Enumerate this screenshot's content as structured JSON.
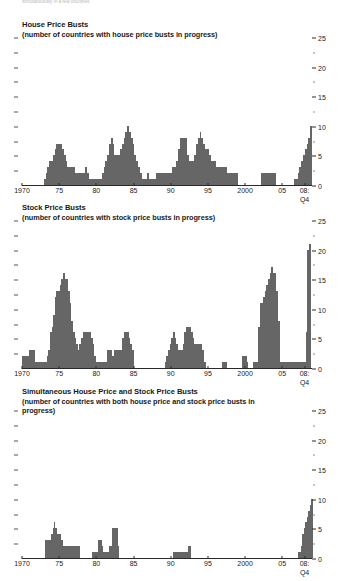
{
  "topnote": "simultaneously in a few countries.",
  "axis": {
    "y_ticks": [
      0,
      5,
      10,
      15,
      20,
      25
    ],
    "y_minor": [
      2.5,
      7.5,
      12.5,
      17.5,
      22.5
    ],
    "ylim": [
      0,
      25
    ],
    "x_ticks": [
      {
        "label": "1970",
        "year": 1970
      },
      {
        "label": "75",
        "year": 1975
      },
      {
        "label": "80",
        "year": 1980
      },
      {
        "label": "85",
        "year": 1985
      },
      {
        "label": "90",
        "year": 1990
      },
      {
        "label": "95",
        "year": 1995
      },
      {
        "label": "2000",
        "year": 2000
      },
      {
        "label": "05",
        "year": 2005
      },
      {
        "label": "08:",
        "year": 2008
      }
    ],
    "last_label_line2": "Q4",
    "xlim": [
      1970,
      2009
    ]
  },
  "colors": {
    "bar": "#666666",
    "axis": "#2a2a2a",
    "text": "#1a1a1a",
    "topnote": "#b9b9b9"
  },
  "chart_data": [
    {
      "type": "bar",
      "title": "House Price Busts",
      "subtitle": "(number of countries with house price busts in progress)",
      "xlabel": "",
      "ylabel": "",
      "ylim": [
        0,
        25
      ],
      "grid": false,
      "legend": "none",
      "y_axis_position": "right",
      "x_start_year": 1970,
      "quarterly": true,
      "values": [
        0,
        0,
        0,
        0,
        0,
        0,
        0,
        0,
        0,
        0,
        0,
        0,
        1,
        2,
        3,
        4,
        4,
        5,
        6,
        7,
        7,
        7,
        6,
        5,
        4,
        3,
        3,
        3,
        3,
        2,
        2,
        2,
        2,
        2,
        2,
        3,
        2,
        1,
        1,
        1,
        1,
        1,
        1,
        1,
        2,
        3,
        4,
        5,
        7,
        8,
        7,
        5,
        5,
        5,
        6,
        7,
        8,
        9,
        10,
        9,
        8,
        7,
        5,
        4,
        3,
        2,
        1,
        1,
        1,
        2,
        1,
        1,
        1,
        1,
        2,
        2,
        2,
        2,
        2,
        2,
        2,
        2,
        2,
        3,
        3,
        4,
        6,
        8,
        8,
        8,
        8,
        5,
        4,
        4,
        4,
        5,
        7,
        8,
        9,
        8,
        7,
        6,
        6,
        5,
        4,
        4,
        4,
        3,
        3,
        3,
        3,
        3,
        3,
        2,
        2,
        2,
        2,
        2,
        2,
        0,
        0,
        0,
        0,
        0,
        0,
        0,
        0,
        0,
        0,
        0,
        0,
        0,
        2,
        2,
        2,
        2,
        2,
        2,
        2,
        2,
        0,
        0,
        0,
        0,
        0,
        0,
        0,
        0,
        0,
        0,
        1,
        1,
        2,
        3,
        4,
        5,
        6,
        7,
        8,
        10
      ]
    },
    {
      "type": "bar",
      "title": "Stock Price Busts",
      "subtitle": "(number of countries with stock price busts in progress)",
      "xlabel": "",
      "ylabel": "",
      "ylim": [
        0,
        25
      ],
      "grid": false,
      "legend": "none",
      "y_axis_position": "right",
      "x_start_year": 1970,
      "quarterly": true,
      "values": [
        2,
        2,
        2,
        2,
        3,
        3,
        3,
        3,
        1,
        1,
        1,
        1,
        1,
        1,
        1,
        2,
        3,
        6,
        7,
        9,
        12,
        13,
        13,
        14,
        15,
        16,
        15,
        15,
        13,
        11,
        8,
        6,
        5,
        4,
        3,
        4,
        5,
        6,
        6,
        6,
        6,
        6,
        5,
        4,
        2,
        1,
        1,
        1,
        1,
        1,
        1,
        1,
        3,
        3,
        3,
        2,
        3,
        3,
        3,
        3,
        3,
        5,
        6,
        6,
        6,
        5,
        4,
        3,
        0,
        0,
        0,
        0,
        0,
        0,
        0,
        0,
        0,
        0,
        0,
        0,
        0,
        0,
        0,
        0,
        0,
        0,
        0,
        1,
        2,
        3,
        4,
        5,
        6,
        5,
        4,
        3,
        3,
        3,
        4,
        6,
        7,
        7,
        7,
        6,
        5,
        4,
        4,
        4,
        4,
        4,
        3,
        1,
        0,
        0,
        0,
        0,
        0,
        0,
        0,
        0,
        0,
        0,
        1,
        1,
        1,
        0,
        0,
        0,
        0,
        0,
        0,
        0,
        0,
        0,
        2,
        2,
        2,
        1,
        0,
        0,
        0,
        1,
        1,
        1,
        7,
        11,
        11,
        12,
        13,
        14,
        15,
        16,
        17,
        16,
        16,
        13,
        8,
        1,
        1,
        1,
        1,
        1,
        1,
        1,
        1,
        1,
        1,
        1,
        1,
        1,
        1,
        1,
        1,
        6,
        20,
        21
      ]
    },
    {
      "type": "bar",
      "title": "Simultaneous House Price and Stock Price Busts",
      "subtitle": "(number of countries with both house price and stock price busts in progress)",
      "xlabel": "",
      "ylabel": "",
      "ylim": [
        0,
        25
      ],
      "grid": false,
      "legend": "none",
      "y_axis_position": "right",
      "x_start_year": 1970,
      "quarterly": true,
      "values": [
        0,
        0,
        0,
        0,
        0,
        0,
        0,
        0,
        0,
        0,
        0,
        0,
        0,
        0,
        0,
        0,
        3,
        3,
        3,
        3,
        4,
        5,
        6,
        5,
        4,
        4,
        4,
        3,
        2,
        2,
        2,
        2,
        2,
        2,
        2,
        2,
        2,
        2,
        2,
        2,
        0,
        0,
        0,
        0,
        0,
        0,
        0,
        0,
        1,
        1,
        1,
        1,
        3,
        3,
        3,
        2,
        1,
        1,
        1,
        1,
        2,
        2,
        5,
        5,
        5,
        5,
        2,
        0,
        0,
        0,
        0,
        0,
        0,
        0,
        0,
        0,
        0,
        0,
        0,
        0,
        0,
        0,
        0,
        0,
        0,
        0,
        0,
        0,
        0,
        0,
        0,
        0,
        0,
        0,
        0,
        0,
        0,
        0,
        0,
        0,
        0,
        0,
        0,
        0,
        1,
        1,
        1,
        1,
        1,
        1,
        1,
        1,
        1,
        1,
        2,
        2,
        0,
        0,
        0,
        0,
        0,
        0,
        0,
        0,
        0,
        0,
        0,
        0,
        0,
        0,
        0,
        0,
        0,
        0,
        0,
        0,
        0,
        0,
        0,
        0,
        0,
        0,
        0,
        0,
        0,
        0,
        0,
        0,
        0,
        0,
        0,
        0,
        0,
        0,
        0,
        0,
        0,
        0,
        0,
        0,
        0,
        0,
        0,
        0,
        0,
        0,
        0,
        0,
        0,
        0,
        0,
        0,
        0,
        0,
        0,
        0,
        0,
        0,
        0,
        0,
        0,
        0,
        0,
        0,
        0,
        0,
        0,
        0,
        0,
        0,
        1,
        1,
        2,
        4,
        5,
        6,
        7,
        8,
        9,
        10
      ]
    }
  ]
}
